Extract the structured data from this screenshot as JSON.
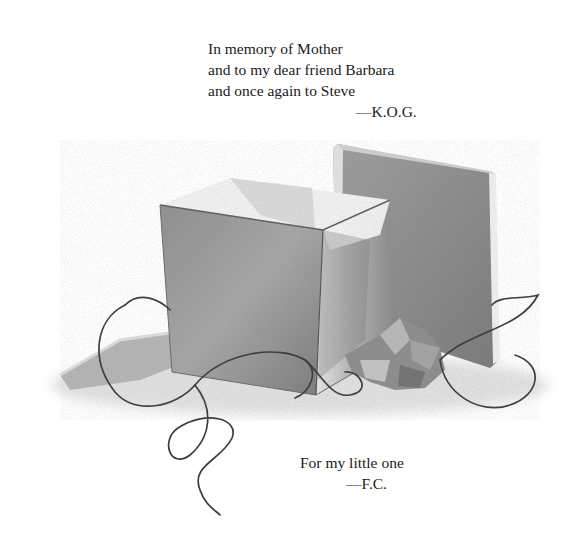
{
  "dedications": {
    "author": {
      "lines": [
        "In memory of Mother",
        "and to my dear friend Barbara",
        "and once again to Steve"
      ],
      "signature": "—K.O.G."
    },
    "illustrator": {
      "lines": [
        "For my little one"
      ],
      "signature": "—F.C."
    }
  },
  "illustration": {
    "subject": "open-gift-box-with-lid-ribbon-and-tissue",
    "style": "graphite-pencil",
    "colors": {
      "paper": "#ffffff",
      "shade_dark": "#6e6e6e",
      "shade_mid": "#9a9a9a",
      "shade_light": "#d2d2d2",
      "ribbon": "#3a3a3a"
    }
  }
}
